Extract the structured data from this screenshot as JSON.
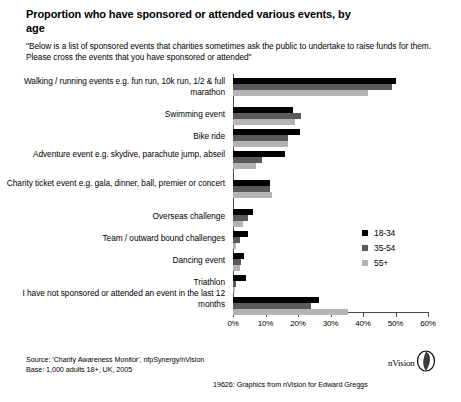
{
  "header": {
    "title": "Proportion who have sponsored or attended various events, by age",
    "subtitle": "\"Below is a list of sponsored events that charities sometimes ask the public to undertake to raise funds for them.  Please cross the events that you have sponsored or attended\""
  },
  "footer": {
    "source_line1": "Source: 'Charity Awareness Monitor', nfpSynergy/nVision",
    "source_line2": "Base: 1,000 adults 18+, UK, 2005",
    "credit": "19626: Graphics from  nVision  for Edward Greggs",
    "logo_text": "nVision"
  },
  "chart_data": {
    "type": "bar",
    "orientation": "horizontal",
    "title": "Proportion who have sponsored or attended various events, by age",
    "xlabel": "",
    "ylabel": "",
    "xlim": [
      0,
      60
    ],
    "xticks": [
      0,
      10,
      20,
      30,
      40,
      50,
      60
    ],
    "xtick_labels": [
      "0%",
      "10%",
      "20%",
      "30%",
      "40%",
      "50%",
      "60%"
    ],
    "grid": false,
    "legend_position": "right-middle",
    "categories": [
      "Walking / running events e.g. fun run, 10k run, 1/2 & full marathon",
      "Swimming event",
      "Bike ride",
      "Adventure event e.g. skydive, parachute jump, abseil",
      "Charity ticket event e.g. gala, dinner, ball, premier or concert",
      "Overseas challenge",
      "Team / outward bound challenges",
      "Dancing event",
      "Triathlon",
      "I have not sponsored or attended an event in the last 12 months"
    ],
    "series": [
      {
        "name": "18-34",
        "color": "#000000",
        "values": [
          50,
          18.5,
          20.5,
          16,
          11.5,
          6,
          4.5,
          3.5,
          4,
          26.5
        ]
      },
      {
        "name": "35-54",
        "color": "#5a5a5a",
        "values": [
          49,
          21,
          17,
          9,
          11.5,
          4.5,
          2,
          2.5,
          1,
          24
        ]
      },
      {
        "name": "55+",
        "color": "#b4b4b4",
        "values": [
          41.5,
          19,
          17,
          7,
          12,
          3,
          1,
          2,
          0.5,
          35.5
        ]
      }
    ]
  }
}
